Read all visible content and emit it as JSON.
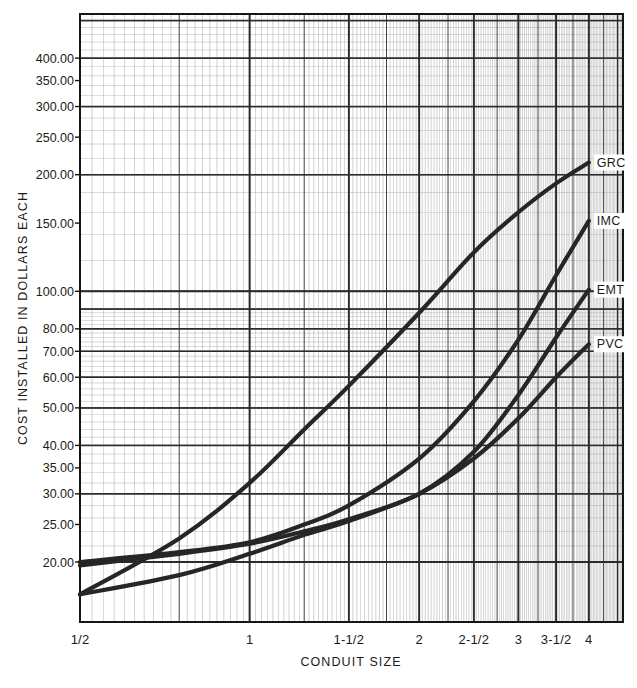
{
  "chart_data": {
    "type": "line",
    "title": "",
    "xlabel": "CONDUIT SIZE",
    "ylabel": "COST INSTALLED IN DOLLARS EACH",
    "xscale": "log",
    "yscale": "log",
    "grid": true,
    "grid_style": "log-log graph paper, minor and major rulings",
    "legend_position": "inline-right-of-curve-ends",
    "xlim": [
      0.5,
      4.6
    ],
    "ylim": [
      14.0,
      520.0
    ],
    "x_tick_labels": [
      "1/2",
      "1",
      "1-1/2",
      "2",
      "2-1/2",
      "3",
      "3-1/2",
      "4"
    ],
    "x_tick_values": [
      0.5,
      1.0,
      1.5,
      2.0,
      2.5,
      3.0,
      3.5,
      4.0
    ],
    "y_tick_labels": [
      "400.00",
      "350.00",
      "300.00",
      "250.00",
      "200.00",
      "150.00",
      "100.00",
      "80.00",
      "70.00",
      "60.00",
      "50.00",
      "40.00",
      "35.00",
      "30.00",
      "25.00",
      "20.00"
    ],
    "y_tick_values": [
      400,
      350,
      300,
      250,
      200,
      150,
      100,
      80,
      70,
      60,
      50,
      40,
      35,
      30,
      25,
      20
    ],
    "x": [
      0.5,
      0.75,
      1.0,
      1.25,
      1.5,
      2.0,
      2.5,
      3.0,
      3.5,
      4.0
    ],
    "series": [
      {
        "name": "GRC",
        "label": "GRC",
        "color": "#262626",
        "values": [
          16.5,
          23.0,
          32.0,
          44.0,
          57.0,
          88.0,
          126.0,
          160.0,
          190.0,
          215.0
        ]
      },
      {
        "name": "IMC",
        "label": "IMC",
        "color": "#262626",
        "values": [
          20.0,
          21.2,
          22.5,
          25.0,
          28.0,
          37.0,
          52.0,
          75.0,
          110.0,
          152.0
        ]
      },
      {
        "name": "EMT",
        "label": "EMT",
        "color": "#262626",
        "values": [
          19.6,
          21.0,
          22.3,
          24.0,
          25.8,
          30.0,
          38.5,
          54.0,
          76.0,
          101.0
        ]
      },
      {
        "name": "PVC",
        "label": "PVC",
        "color": "#262626",
        "values": [
          16.5,
          18.5,
          21.0,
          23.5,
          25.5,
          30.0,
          37.0,
          47.0,
          60.0,
          73.0
        ]
      }
    ]
  },
  "colors": {
    "curve": "#262626",
    "grid_minor": "#9a9a9a",
    "grid_major": "#2b2b2b",
    "frame": "#151515",
    "background": "#ffffff",
    "text": "#1a1a1a"
  }
}
